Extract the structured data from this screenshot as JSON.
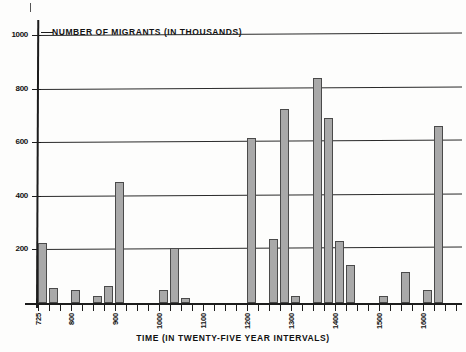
{
  "chart_data": {
    "type": "bar",
    "title": "",
    "ylabel": "NUMBER OF MIGRANTS (IN THOUSANDS)",
    "xlabel": "TIME (IN TWENTY-FIVE YEAR INTERVALS)",
    "ylim": [
      0,
      1040
    ],
    "yticks": [
      200,
      400,
      600,
      800,
      1000
    ],
    "ytick_labels": [
      "200",
      "400",
      "600",
      "800",
      "1000"
    ],
    "xlim": [
      725,
      1675
    ],
    "xtick_interval": 25,
    "xtick_labels": [
      "725",
      "800",
      "900",
      "1000",
      "1100",
      "1200",
      "1300",
      "1400",
      "1500",
      "1600"
    ],
    "labeled_x": [
      725,
      800,
      900,
      1000,
      1100,
      1200,
      1300,
      1400,
      1500,
      1600
    ],
    "grid": true,
    "legend": false,
    "bar_fill": "#a9a9a9",
    "bar_edge": "#4a4a4a",
    "x": [
      725,
      750,
      800,
      850,
      875,
      900,
      1000,
      1025,
      1050,
      1200,
      1250,
      1275,
      1300,
      1350,
      1375,
      1400,
      1425,
      1500,
      1550,
      1600,
      1625
    ],
    "values": [
      225,
      55,
      50,
      25,
      65,
      450,
      50,
      205,
      20,
      615,
      240,
      725,
      25,
      840,
      690,
      230,
      140,
      25,
      115,
      50,
      660
    ],
    "categories": [
      "725",
      "750",
      "800",
      "850",
      "875",
      "900",
      "1000",
      "1025",
      "1050",
      "1200",
      "1250",
      "1275",
      "1300",
      "1350",
      "1375",
      "1400",
      "1425",
      "1500",
      "1550",
      "1600",
      "1625"
    ]
  }
}
